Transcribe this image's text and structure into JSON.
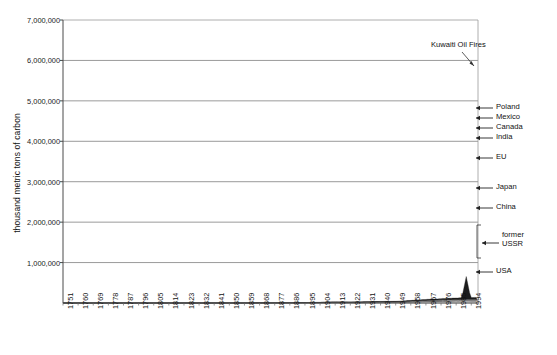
{
  "chart_data": {
    "type": "area",
    "stacked": true,
    "title": "",
    "xlabel": "",
    "ylabel": "thousand metric tons of carbon",
    "ylim": [
      0,
      7000000
    ],
    "yticks": [
      "1,000,000",
      "2,000,000",
      "3,000,000",
      "4,000,000",
      "5,000,000",
      "6,000,000",
      "7,000,000"
    ],
    "ytick_values": [
      1000000,
      2000000,
      3000000,
      4000000,
      5000000,
      6000000,
      7000000
    ],
    "grid": true,
    "legend_position": "right-inline",
    "xticks": [
      "1751",
      "1760",
      "1769",
      "1778",
      "1787",
      "1796",
      "1805",
      "1814",
      "1823",
      "1832",
      "1841",
      "1850",
      "1859",
      "1868",
      "1877",
      "1886",
      "1895",
      "1904",
      "1913",
      "1922",
      "1931",
      "1940",
      "1949",
      "1958",
      "1967",
      "1976",
      "1985",
      "1994"
    ],
    "xlim": [
      1751,
      1998
    ],
    "annotations": [
      {
        "text": "Kuwaiti Oil Fires",
        "x": 1991,
        "y": 6050000
      }
    ],
    "series_labels": [
      "USA",
      "former USSR",
      "China",
      "Japan",
      "EU",
      "India",
      "Canada",
      "Mexico",
      "Poland"
    ],
    "colors": {
      "USA": "#8e8e8e",
      "former USSR": "#f2f2f2",
      "China": "#9b9b9b",
      "Japan": "#3a3a3a",
      "EU": "#6b6b6b",
      "India": "#efefef",
      "Canada": "#2b2b2b",
      "Mexico": "#bdbdbd",
      "Poland": "#555555",
      "Other": "#1c1c1c",
      "axis": "#555555",
      "grid": "#9a9a9a"
    },
    "x": [
      1751,
      1760,
      1769,
      1778,
      1787,
      1796,
      1805,
      1814,
      1823,
      1832,
      1841,
      1850,
      1859,
      1868,
      1877,
      1886,
      1895,
      1904,
      1913,
      1922,
      1931,
      1940,
      1949,
      1958,
      1967,
      1976,
      1985,
      1991,
      1994,
      1996
    ],
    "series": [
      {
        "name": "USA",
        "values": [
          0,
          0,
          0,
          0,
          0,
          1,
          2,
          4,
          8,
          15,
          30,
          65,
          140,
          270,
          520,
          840,
          1350,
          2100,
          3400,
          4200,
          4100,
          5500,
          6900,
          7700,
          11900,
          12600,
          12900,
          13300,
          14000,
          14700
        ]
      },
      {
        "name": "former USSR",
        "values": [
          0,
          0,
          0,
          0,
          0,
          0,
          0,
          1,
          2,
          4,
          8,
          16,
          35,
          70,
          150,
          300,
          600,
          1200,
          2200,
          1400,
          3300,
          6000,
          8000,
          14000,
          20000,
          24000,
          26000,
          25000,
          19000,
          17500
        ]
      },
      {
        "name": "China",
        "values": [
          0,
          0,
          0,
          0,
          0,
          0,
          0,
          0,
          0,
          0,
          1,
          2,
          4,
          8,
          15,
          30,
          70,
          150,
          300,
          400,
          600,
          1100,
          1100,
          3200,
          5200,
          8000,
          12000,
          17000,
          20000,
          21500
        ]
      },
      {
        "name": "Japan",
        "values": [
          0,
          0,
          0,
          0,
          0,
          0,
          0,
          0,
          0,
          0,
          0,
          1,
          2,
          5,
          12,
          30,
          80,
          200,
          450,
          700,
          1200,
          2000,
          900,
          2500,
          5000,
          6500,
          7200,
          8200,
          8800,
          9000
        ]
      },
      {
        "name": "EU",
        "values": [
          3,
          4,
          6,
          9,
          14,
          22,
          38,
          70,
          130,
          230,
          420,
          760,
          1300,
          2200,
          3300,
          4600,
          6100,
          8000,
          10500,
          8500,
          9500,
          10500,
          9000,
          12000,
          13500,
          14500,
          14000,
          13800,
          13500,
          13500
        ]
      },
      {
        "name": "India",
        "values": [
          0,
          0,
          0,
          0,
          0,
          0,
          0,
          0,
          0,
          0,
          0,
          1,
          2,
          5,
          12,
          30,
          70,
          150,
          300,
          400,
          600,
          900,
          900,
          1400,
          2100,
          3000,
          4500,
          6200,
          7000,
          7600
        ]
      },
      {
        "name": "Canada",
        "values": [
          0,
          0,
          0,
          0,
          0,
          0,
          0,
          0,
          1,
          2,
          4,
          8,
          18,
          40,
          80,
          160,
          300,
          550,
          950,
          900,
          1100,
          1500,
          1600,
          2300,
          3000,
          3800,
          4000,
          4200,
          4300,
          4400
        ]
      },
      {
        "name": "Mexico",
        "values": [
          0,
          0,
          0,
          0,
          0,
          0,
          0,
          0,
          0,
          0,
          0,
          1,
          2,
          5,
          10,
          25,
          60,
          130,
          260,
          300,
          400,
          500,
          700,
          1100,
          1800,
          2500,
          3000,
          3400,
          3600,
          3800
        ]
      },
      {
        "name": "Poland",
        "values": [
          0,
          0,
          0,
          0,
          0,
          0,
          0,
          0,
          0,
          1,
          2,
          4,
          10,
          25,
          55,
          110,
          220,
          420,
          750,
          700,
          900,
          1200,
          1300,
          2100,
          2700,
          3200,
          3300,
          2600,
          2500,
          2400
        ]
      },
      {
        "name": "Other",
        "values": [
          1,
          1,
          2,
          3,
          4,
          7,
          12,
          22,
          40,
          70,
          130,
          240,
          430,
          750,
          1250,
          1900,
          2900,
          4300,
          6400,
          6000,
          7500,
          9500,
          10500,
          16000,
          23000,
          30000,
          36000,
          42000,
          43000,
          45000
        ]
      }
    ]
  }
}
